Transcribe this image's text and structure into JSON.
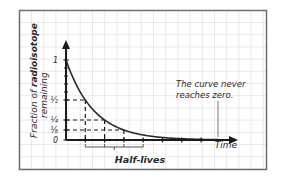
{
  "chart_data": {
    "type": "line",
    "title": "",
    "xlabel": "Time",
    "ylabel_prefix": "Fraction of ",
    "ylabel_bold": "radioisotope",
    "ylabel_line2": "remaining",
    "y_ticks": [
      {
        "label": "1",
        "value": 1
      },
      {
        "label": "½",
        "value": 0.5
      },
      {
        "label": "¼",
        "value": 0.25
      },
      {
        "label": "⅛",
        "value": 0.125
      },
      {
        "label": "0",
        "value": 0
      }
    ],
    "series": [
      {
        "name": "Fraction remaining",
        "x_half_lives": [
          0,
          1,
          2,
          3,
          4,
          5,
          6,
          7
        ],
        "values": [
          1,
          0.5,
          0.25,
          0.125,
          0.0625,
          0.03125,
          0.015625,
          0.0078125
        ]
      }
    ],
    "guides": [
      {
        "half_lives": 1,
        "value": 0.5
      },
      {
        "half_lives": 2,
        "value": 0.25
      },
      {
        "half_lives": 3,
        "value": 0.125
      }
    ],
    "bracket_label": "Half-lives",
    "annotation_line1": "The curve never",
    "annotation_line2": "reaches zero.",
    "grid": true,
    "ylim": [
      0,
      1
    ],
    "xlim_half_lives": [
      0,
      8.5
    ]
  },
  "colors": {
    "axis": "#1a1a1a",
    "grid": "#e4e4e4",
    "frame": "#6e6e6e",
    "curve": "#2a2a2a",
    "text": "#2a2a2a"
  }
}
